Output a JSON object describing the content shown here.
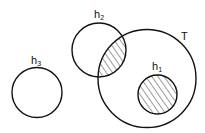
{
  "diagram": {
    "type": "venn",
    "circles": [
      {
        "id": "h3",
        "label": "h",
        "subscript": "3",
        "cx": 37,
        "cy": 92.5,
        "r": 25,
        "hatched": false
      },
      {
        "id": "h2",
        "label": "h",
        "subscript": "2",
        "cx": 99,
        "cy": 50,
        "r": 27,
        "hatched": false
      },
      {
        "id": "T",
        "label": "T",
        "subscript": "",
        "cx": 147,
        "cy": 78.5,
        "r": 49,
        "hatched": false
      },
      {
        "id": "h1",
        "label": "h",
        "subscript": "1",
        "cx": 157.5,
        "cy": 94.5,
        "r": 19.5,
        "hatched": true
      }
    ],
    "hatched_regions": [
      "h1",
      "h2 ∩ T"
    ],
    "stroke_color": "#111111",
    "background": "#ffffff"
  }
}
